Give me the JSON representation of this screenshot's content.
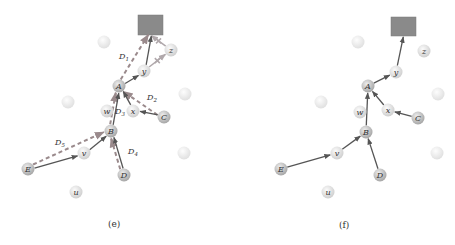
{
  "panels": [
    {
      "id": "e",
      "caption": "(e)",
      "sink": {
        "x": 138,
        "y": 15,
        "w": 25,
        "h": 20,
        "color": "#8a8a8a"
      },
      "nodes": [
        {
          "id": "z",
          "label": "z",
          "x": 171,
          "y": 50,
          "kind": "relay"
        },
        {
          "id": "y",
          "label": "y",
          "x": 144,
          "y": 71,
          "kind": "relay"
        },
        {
          "id": "A",
          "label": "A",
          "x": 119,
          "y": 86,
          "kind": "source"
        },
        {
          "id": "x",
          "label": "x",
          "x": 133,
          "y": 111,
          "kind": "relay"
        },
        {
          "id": "C",
          "label": "C",
          "x": 164,
          "y": 117,
          "kind": "source"
        },
        {
          "id": "w",
          "label": "w",
          "x": 107,
          "y": 111,
          "kind": "relay"
        },
        {
          "id": "B",
          "label": "B",
          "x": 111,
          "y": 131,
          "kind": "source"
        },
        {
          "id": "v",
          "label": "v",
          "x": 84,
          "y": 153,
          "kind": "relay"
        },
        {
          "id": "E",
          "label": "E",
          "x": 28,
          "y": 169,
          "kind": "source"
        },
        {
          "id": "D",
          "label": "D",
          "x": 124,
          "y": 175,
          "kind": "source"
        },
        {
          "id": "u",
          "label": "u",
          "x": 76,
          "y": 192,
          "kind": "relay"
        }
      ],
      "blank_nodes": [
        {
          "x": 104,
          "y": 42
        },
        {
          "x": 68,
          "y": 102
        },
        {
          "x": 185,
          "y": 94
        },
        {
          "x": 184,
          "y": 153
        }
      ],
      "solid_edges": [
        [
          "y",
          "sink"
        ],
        [
          "A",
          "y"
        ],
        [
          "B",
          "A"
        ],
        [
          "C",
          "x"
        ],
        [
          "x",
          "A"
        ],
        [
          "v",
          "B"
        ],
        [
          "E",
          "v"
        ],
        [
          "D",
          "B"
        ]
      ],
      "dashed_edges": [
        [
          "A",
          "sink"
        ],
        [
          "C",
          "A"
        ],
        [
          "B",
          "A"
        ],
        [
          "E",
          "B"
        ],
        [
          "D",
          "B"
        ]
      ],
      "crossed_edges": [
        [
          "y",
          "z"
        ],
        [
          "z",
          "sink"
        ]
      ],
      "path_labels": [
        {
          "main": "D",
          "sub": "1",
          "x": 119,
          "y": 59
        },
        {
          "main": "D",
          "sub": "2",
          "x": 147,
          "y": 100
        },
        {
          "main": "D",
          "sub": "3",
          "x": 115,
          "y": 114
        },
        {
          "main": "D",
          "sub": "4",
          "x": 128,
          "y": 154
        },
        {
          "main": "D",
          "sub": "5",
          "x": 55,
          "y": 145
        }
      ]
    },
    {
      "id": "f",
      "caption": "(f)",
      "sink": {
        "x": 391,
        "y": 17,
        "w": 25,
        "h": 19,
        "color": "#8a8a8a"
      },
      "nodes": [
        {
          "id": "z",
          "label": "z",
          "x": 424,
          "y": 51,
          "kind": "relay"
        },
        {
          "id": "y",
          "label": "y",
          "x": 396,
          "y": 72,
          "kind": "relay"
        },
        {
          "id": "A",
          "label": "A",
          "x": 368,
          "y": 86,
          "kind": "source"
        },
        {
          "id": "x",
          "label": "x",
          "x": 388,
          "y": 110,
          "kind": "relay"
        },
        {
          "id": "C",
          "label": "C",
          "x": 418,
          "y": 118,
          "kind": "source"
        },
        {
          "id": "w",
          "label": "w",
          "x": 360,
          "y": 112,
          "kind": "relay"
        },
        {
          "id": "B",
          "label": "B",
          "x": 366,
          "y": 132,
          "kind": "source"
        },
        {
          "id": "v",
          "label": "v",
          "x": 337,
          "y": 153,
          "kind": "relay"
        },
        {
          "id": "E",
          "label": "E",
          "x": 281,
          "y": 169,
          "kind": "source"
        },
        {
          "id": "D",
          "label": "D",
          "x": 380,
          "y": 175,
          "kind": "source"
        },
        {
          "id": "u",
          "label": "u",
          "x": 328,
          "y": 192,
          "kind": "relay"
        }
      ],
      "blank_nodes": [
        {
          "x": 358,
          "y": 42
        },
        {
          "x": 321,
          "y": 102
        },
        {
          "x": 438,
          "y": 94
        },
        {
          "x": 437,
          "y": 153
        }
      ],
      "solid_edges": [
        [
          "y",
          "sink"
        ],
        [
          "A",
          "y"
        ],
        [
          "B",
          "A"
        ],
        [
          "C",
          "x"
        ],
        [
          "x",
          "A"
        ],
        [
          "v",
          "B"
        ],
        [
          "E",
          "v"
        ],
        [
          "D",
          "B"
        ]
      ],
      "dashed_edges": [],
      "crossed_edges": [],
      "path_labels": []
    }
  ],
  "colors": {
    "solid_edge": "#555555",
    "dashed_edge": "#9a8a8c",
    "crossed_edge": "#b0a8ab",
    "source_fill": "#b9b9b9",
    "relay_fill": "#dcdcdc",
    "blank_fill": "#ececec"
  },
  "captions": {
    "e": "(e)",
    "f": "(f)"
  }
}
